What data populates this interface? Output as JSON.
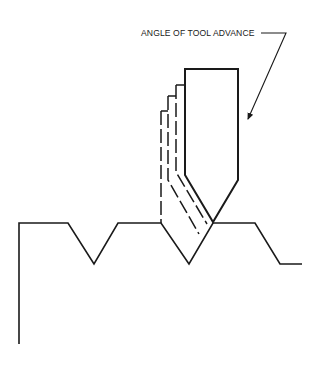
{
  "diagram": {
    "label": "ANGLE OF TOOL ADVANCE",
    "colors": {
      "line": "#1a1a1a",
      "background": "#ffffff"
    },
    "thread_profile": "19,344 19,223 68,223 94,264 118,223 161,223 189,264 213,223 255,223 280,264 302,264",
    "tool_outline": "185,69 238,69 238,180 213,222 185,175 185,69",
    "tool_prev_positions": [
      {
        "top": "176,85 185,85",
        "dash": "176,85 176,180 201,222"
      },
      {
        "top": "168,96 176,96",
        "dash": "168,96 168,186 195,232"
      },
      {
        "top": "161,111 168,111",
        "dash": "161,111 161,223 189,264"
      }
    ],
    "leader": {
      "path": "261,33 286,33 248,119",
      "arrow_tip": "248,119"
    }
  }
}
